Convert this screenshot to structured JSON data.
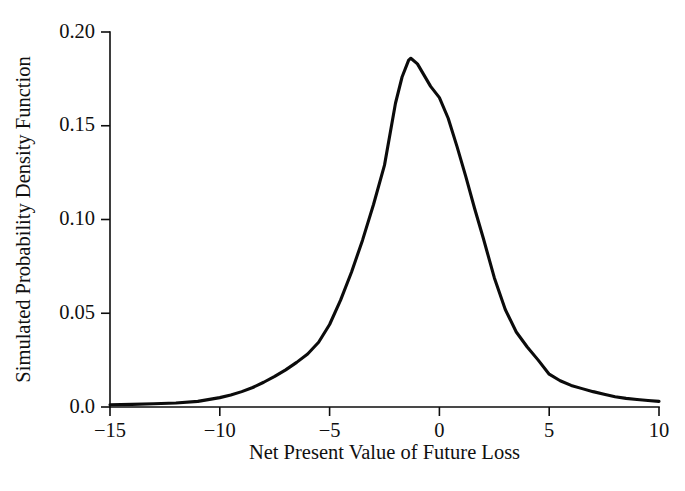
{
  "chart_data": {
    "type": "line",
    "title": "",
    "subtitle": "",
    "xlabel": "Net Present Value of Future Loss",
    "ylabel": "Simulated Probability Density Function",
    "xlim": [
      -15,
      10
    ],
    "ylim": [
      0.0,
      0.2
    ],
    "grid": false,
    "legend": "none",
    "xticks": [
      -15,
      -10,
      -5,
      0,
      5,
      10
    ],
    "xtick_labels": [
      "−15",
      "−10",
      "−5",
      "0",
      "5",
      "10"
    ],
    "yticks": [
      0.0,
      0.05,
      0.1,
      0.15,
      0.2
    ],
    "ytick_labels": [
      "0.0",
      "0.05",
      "0.10",
      "0.15",
      "0.20"
    ],
    "series": [
      {
        "name": "Simulated probability density",
        "color": "#0b0b0b",
        "linewidth": 3.1,
        "x": [
          -15.0,
          -14.0,
          -13.0,
          -12.0,
          -11.0,
          -10.0,
          -9.5,
          -9.0,
          -8.5,
          -8.0,
          -7.5,
          -7.0,
          -6.5,
          -6.0,
          -5.5,
          -5.0,
          -4.5,
          -4.0,
          -3.5,
          -3.0,
          -2.5,
          -2.0,
          -1.7,
          -1.4,
          -1.3,
          -1.0,
          -0.7,
          -0.4,
          0.0,
          0.4,
          0.8,
          1.2,
          1.6,
          2.0,
          2.5,
          3.0,
          3.5,
          4.0,
          4.5,
          5.0,
          5.5,
          6.0,
          6.5,
          7.0,
          7.5,
          8.0,
          8.5,
          9.0,
          9.5,
          10.0
        ],
        "y": [
          0.0012,
          0.0014,
          0.0017,
          0.0021,
          0.003,
          0.005,
          0.0064,
          0.0082,
          0.0104,
          0.0132,
          0.0163,
          0.0198,
          0.0238,
          0.0283,
          0.0345,
          0.044,
          0.057,
          0.072,
          0.089,
          0.108,
          0.129,
          0.162,
          0.176,
          0.185,
          0.186,
          0.183,
          0.177,
          0.171,
          0.165,
          0.154,
          0.139,
          0.123,
          0.106,
          0.09,
          0.069,
          0.052,
          0.04,
          0.032,
          0.025,
          0.0175,
          0.014,
          0.0115,
          0.0098,
          0.0082,
          0.0068,
          0.0055,
          0.0046,
          0.004,
          0.0035,
          0.003
        ]
      }
    ],
    "axes_style": {
      "spines": "left-and-bottom",
      "tick_direction": "out",
      "axis_color": "#0d0d0d",
      "background": "#ffffff"
    }
  },
  "figure": {
    "background_color": "#ffffff",
    "width": 685,
    "height": 491
  }
}
